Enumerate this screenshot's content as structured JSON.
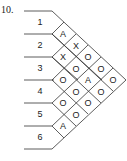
{
  "problem_number": "10.",
  "row_labels": [
    "1",
    "2",
    "3",
    "4",
    "5",
    "6"
  ],
  "cells": [
    {
      "row": 1,
      "col": 0,
      "value": "A"
    },
    {
      "row": 1,
      "col": 1,
      "value": "X"
    },
    {
      "row": 2,
      "col": 0,
      "value": "X"
    },
    {
      "row": 2,
      "col": 1,
      "value": "O"
    },
    {
      "row": 2,
      "col": 2,
      "value": "O"
    },
    {
      "row": 3,
      "col": 0,
      "value": "O"
    },
    {
      "row": 3,
      "col": 1,
      "value": "A"
    },
    {
      "row": 3,
      "col": 2,
      "value": "O"
    },
    {
      "row": 3,
      "col": 3,
      "value": "O"
    },
    {
      "row": 4,
      "col": 0,
      "value": "O"
    },
    {
      "row": 4,
      "col": 1,
      "value": "O"
    },
    {
      "row": 4,
      "col": 2,
      "value": "O"
    },
    {
      "row": 5,
      "col": 0,
      "value": "O"
    },
    {
      "row": 5,
      "col": 1,
      "value": "O"
    },
    {
      "row": 6,
      "col": 0,
      "value": "A"
    }
  ],
  "grid_letters": {
    "c0": "A",
    "c1": "X",
    "c2": "X",
    "c3": "O",
    "c4": "O",
    "c5": "O",
    "c6": "A",
    "c7": "O",
    "c8": "O",
    "c9": "O",
    "c10": "O",
    "c11": "O",
    "c12": "O",
    "c13": "O",
    "c14": "A"
  }
}
